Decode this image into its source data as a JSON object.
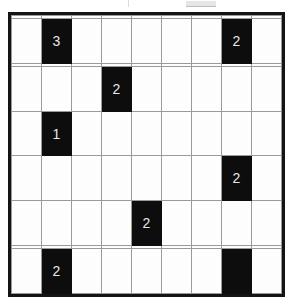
{
  "puzzle": {
    "title": "Black Cell Number Grid Puzzle",
    "type": "grid-puzzle",
    "rows": 9,
    "columns": 9,
    "colors": {
      "filled_cell": "#0d0d0d",
      "empty_cell": "#fdfdfd",
      "grid_line": "#9a9a9a",
      "outer_border": "#141414",
      "clue_text": "#e8e8e8"
    },
    "cells": [
      [
        {
          "filled": false,
          "label": ""
        },
        {
          "filled": false,
          "label": ""
        },
        {
          "filled": false,
          "label": ""
        },
        {
          "filled": false,
          "label": ""
        },
        {
          "filled": false,
          "label": ""
        },
        {
          "filled": false,
          "label": ""
        },
        {
          "filled": false,
          "label": ""
        },
        {
          "filled": false,
          "label": ""
        },
        {
          "filled": false,
          "label": ""
        }
      ],
      [
        {
          "filled": false,
          "label": ""
        },
        {
          "filled": true,
          "label": "3"
        },
        {
          "filled": false,
          "label": ""
        },
        {
          "filled": false,
          "label": ""
        },
        {
          "filled": false,
          "label": ""
        },
        {
          "filled": false,
          "label": ""
        },
        {
          "filled": false,
          "label": ""
        },
        {
          "filled": true,
          "label": "2"
        },
        {
          "filled": false,
          "label": ""
        }
      ],
      [
        {
          "filled": false,
          "label": ""
        },
        {
          "filled": false,
          "label": ""
        },
        {
          "filled": false,
          "label": ""
        },
        {
          "filled": false,
          "label": ""
        },
        {
          "filled": false,
          "label": ""
        },
        {
          "filled": false,
          "label": ""
        },
        {
          "filled": false,
          "label": ""
        },
        {
          "filled": false,
          "label": ""
        },
        {
          "filled": false,
          "label": ""
        }
      ],
      [
        {
          "filled": false,
          "label": ""
        },
        {
          "filled": false,
          "label": ""
        },
        {
          "filled": false,
          "label": ""
        },
        {
          "filled": true,
          "label": "2"
        },
        {
          "filled": false,
          "label": ""
        },
        {
          "filled": false,
          "label": ""
        },
        {
          "filled": false,
          "label": ""
        },
        {
          "filled": false,
          "label": ""
        },
        {
          "filled": false,
          "label": ""
        }
      ],
      [
        {
          "filled": false,
          "label": ""
        },
        {
          "filled": true,
          "label": "1"
        },
        {
          "filled": false,
          "label": ""
        },
        {
          "filled": false,
          "label": ""
        },
        {
          "filled": false,
          "label": ""
        },
        {
          "filled": false,
          "label": ""
        },
        {
          "filled": false,
          "label": ""
        },
        {
          "filled": false,
          "label": ""
        },
        {
          "filled": false,
          "label": ""
        }
      ],
      [
        {
          "filled": false,
          "label": ""
        },
        {
          "filled": false,
          "label": ""
        },
        {
          "filled": false,
          "label": ""
        },
        {
          "filled": false,
          "label": ""
        },
        {
          "filled": false,
          "label": ""
        },
        {
          "filled": false,
          "label": ""
        },
        {
          "filled": false,
          "label": ""
        },
        {
          "filled": true,
          "label": "2"
        },
        {
          "filled": false,
          "label": ""
        }
      ],
      [
        {
          "filled": false,
          "label": ""
        },
        {
          "filled": false,
          "label": ""
        },
        {
          "filled": false,
          "label": ""
        },
        {
          "filled": false,
          "label": ""
        },
        {
          "filled": true,
          "label": "2"
        },
        {
          "filled": false,
          "label": ""
        },
        {
          "filled": false,
          "label": ""
        },
        {
          "filled": false,
          "label": ""
        },
        {
          "filled": false,
          "label": ""
        }
      ],
      [
        {
          "filled": false,
          "label": ""
        },
        {
          "filled": false,
          "label": ""
        },
        {
          "filled": false,
          "label": ""
        },
        {
          "filled": false,
          "label": ""
        },
        {
          "filled": false,
          "label": ""
        },
        {
          "filled": false,
          "label": ""
        },
        {
          "filled": false,
          "label": ""
        },
        {
          "filled": false,
          "label": ""
        },
        {
          "filled": false,
          "label": ""
        }
      ],
      [
        {
          "filled": false,
          "label": ""
        },
        {
          "filled": true,
          "label": "2"
        },
        {
          "filled": false,
          "label": ""
        },
        {
          "filled": false,
          "label": ""
        },
        {
          "filled": false,
          "label": ""
        },
        {
          "filled": false,
          "label": ""
        },
        {
          "filled": false,
          "label": ""
        },
        {
          "filled": true,
          "label": ""
        },
        {
          "filled": false,
          "label": ""
        }
      ]
    ],
    "clues": [
      {
        "row": 1,
        "col": 1,
        "value": "3"
      },
      {
        "row": 1,
        "col": 7,
        "value": "2"
      },
      {
        "row": 3,
        "col": 3,
        "value": "2"
      },
      {
        "row": 4,
        "col": 1,
        "value": "1"
      },
      {
        "row": 5,
        "col": 7,
        "value": "2"
      },
      {
        "row": 6,
        "col": 4,
        "value": "2"
      },
      {
        "row": 8,
        "col": 1,
        "value": "2"
      },
      {
        "row": 8,
        "col": 7,
        "value": ""
      }
    ]
  }
}
